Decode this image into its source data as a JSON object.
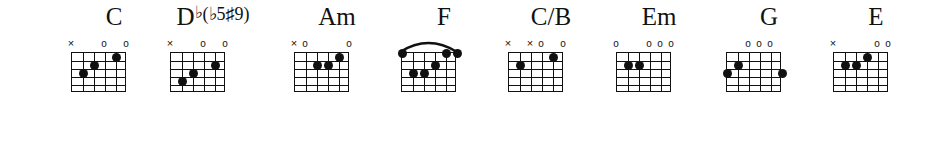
{
  "sheet": {
    "title": "Guitar Chord Diagrams",
    "strings": 6,
    "frets": 5,
    "ink_color": "#111111",
    "background_color": "#ffffff"
  },
  "chords": [
    {
      "name": "C",
      "name_html": "C",
      "x": 59,
      "markers": [
        {
          "string": 6,
          "symbol": "×"
        },
        {
          "string": 3,
          "symbol": "o"
        },
        {
          "string": 1,
          "symbol": "o"
        }
      ],
      "dots": [
        {
          "string": 5,
          "fret": 3
        },
        {
          "string": 4,
          "fret": 2
        },
        {
          "string": 2,
          "fret": 1
        }
      ],
      "barre": null
    },
    {
      "name": "Db(b5#9)",
      "name_html": "D<sup>♭</sup><span class=\"paren\">(♭5♯9)</span>",
      "x": 158,
      "markers": [
        {
          "string": 6,
          "symbol": "×"
        },
        {
          "string": 3,
          "symbol": "o"
        },
        {
          "string": 1,
          "symbol": "o"
        }
      ],
      "dots": [
        {
          "string": 5,
          "fret": 4
        },
        {
          "string": 4,
          "fret": 3
        },
        {
          "string": 2,
          "fret": 2
        }
      ],
      "barre": null
    },
    {
      "name": "Am",
      "name_html": "Am",
      "x": 282,
      "markers": [
        {
          "string": 6,
          "symbol": "×"
        },
        {
          "string": 5,
          "symbol": "o"
        },
        {
          "string": 1,
          "symbol": "o"
        }
      ],
      "dots": [
        {
          "string": 4,
          "fret": 2
        },
        {
          "string": 3,
          "fret": 2
        },
        {
          "string": 2,
          "fret": 1
        }
      ],
      "barre": null
    },
    {
      "name": "F",
      "name_html": "F",
      "x": 389,
      "markers": [],
      "dots": [
        {
          "string": 6,
          "fret": 0
        },
        {
          "string": 5,
          "fret": 3
        },
        {
          "string": 4,
          "fret": 3
        },
        {
          "string": 3,
          "fret": 2
        },
        {
          "string": 2,
          "fret": 0
        },
        {
          "string": 1,
          "fret": 0
        }
      ],
      "barre": {
        "fret": 1,
        "from_string": 6,
        "to_string": 1
      }
    },
    {
      "name": "C/B",
      "name_html": "C/B",
      "x": 496,
      "markers": [
        {
          "string": 6,
          "symbol": "×"
        },
        {
          "string": 4,
          "symbol": "×"
        },
        {
          "string": 3,
          "symbol": "o"
        },
        {
          "string": 1,
          "symbol": "o"
        }
      ],
      "dots": [
        {
          "string": 5,
          "fret": 2
        },
        {
          "string": 2,
          "fret": 1
        }
      ],
      "barre": null
    },
    {
      "name": "Em",
      "name_html": "Em",
      "x": 604,
      "markers": [
        {
          "string": 6,
          "symbol": "o"
        },
        {
          "string": 3,
          "symbol": "o"
        },
        {
          "string": 2,
          "symbol": "o"
        },
        {
          "string": 1,
          "symbol": "o"
        }
      ],
      "dots": [
        {
          "string": 5,
          "fret": 2
        },
        {
          "string": 4,
          "fret": 2
        }
      ],
      "barre": null
    },
    {
      "name": "G",
      "name_html": "G",
      "x": 714,
      "markers": [
        {
          "string": 4,
          "symbol": "o"
        },
        {
          "string": 3,
          "symbol": "o"
        },
        {
          "string": 2,
          "symbol": "o"
        }
      ],
      "dots": [
        {
          "string": 6,
          "fret": 3
        },
        {
          "string": 5,
          "fret": 2
        },
        {
          "string": 1,
          "fret": 3
        }
      ],
      "barre": null
    },
    {
      "name": "E",
      "name_html": "E",
      "x": 821,
      "markers": [
        {
          "string": 6,
          "symbol": "×"
        },
        {
          "string": 2,
          "symbol": "o"
        },
        {
          "string": 1,
          "symbol": "o"
        }
      ],
      "dots": [
        {
          "string": 5,
          "fret": 2
        },
        {
          "string": 4,
          "fret": 2
        },
        {
          "string": 3,
          "fret": 1
        }
      ],
      "barre": null
    }
  ]
}
